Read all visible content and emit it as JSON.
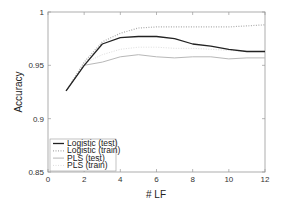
{
  "chart_data": {
    "type": "line",
    "title": "",
    "xlabel": "# LF",
    "ylabel": "Accuracy",
    "xlim": [
      0,
      12
    ],
    "ylim": [
      0.85,
      1
    ],
    "xticks": [
      0,
      2,
      4,
      6,
      8,
      10,
      12
    ],
    "yticks": [
      0.85,
      0.9,
      0.95,
      1
    ],
    "xtick_labels": [
      "0",
      "2",
      "4",
      "6",
      "8",
      "10",
      "12"
    ],
    "ytick_labels": [
      "0.85",
      "0.9",
      "0.95",
      "1"
    ],
    "grid": false,
    "legend_position": "lower left",
    "x": [
      1,
      2,
      3,
      4,
      5,
      6,
      7,
      8,
      9,
      10,
      11,
      12
    ],
    "series": [
      {
        "name": "Logistic (test)",
        "color": "#222222",
        "style": "solid",
        "width": 1.3,
        "values": [
          0.926,
          0.95,
          0.97,
          0.976,
          0.977,
          0.977,
          0.975,
          0.97,
          0.968,
          0.965,
          0.963,
          0.963
        ]
      },
      {
        "name": "Logistic (train)",
        "color": "#aaaaaa",
        "style": "dotted",
        "width": 1.2,
        "values": [
          0.926,
          0.953,
          0.972,
          0.98,
          0.985,
          0.986,
          0.986,
          0.986,
          0.986,
          0.986,
          0.987,
          0.988
        ]
      },
      {
        "name": "PLS (test)",
        "color": "#b8b8b8",
        "style": "solid",
        "width": 1.0,
        "values": [
          0.926,
          0.95,
          0.953,
          0.958,
          0.96,
          0.958,
          0.957,
          0.958,
          0.958,
          0.956,
          0.957,
          0.957
        ]
      },
      {
        "name": "PLS (train)",
        "color": "#dddddd",
        "style": "dotted",
        "width": 1.0,
        "values": [
          0.926,
          0.952,
          0.96,
          0.965,
          0.967,
          0.967,
          0.966,
          0.966,
          0.965,
          0.964,
          0.963,
          0.963
        ]
      }
    ]
  },
  "labels": {
    "xlabel": "# LF",
    "ylabel": "Accuracy"
  },
  "legend": [
    {
      "label": "Logistic (test)"
    },
    {
      "label": "Logistic (train)"
    },
    {
      "label": "PLS (test)"
    },
    {
      "label": "PLS (train)"
    }
  ]
}
